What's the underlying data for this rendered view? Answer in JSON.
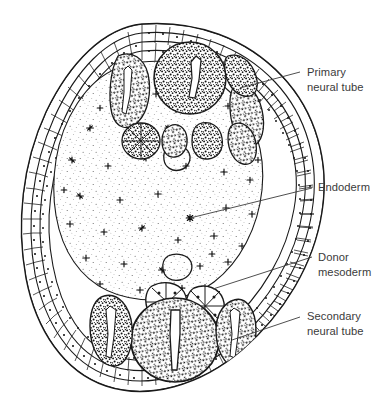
{
  "figure": {
    "name": "embryo-cross-section",
    "background_color": "#ffffff",
    "ink_color": "#1a1a1a",
    "label_color": "#3b3b3b"
  },
  "labels": [
    {
      "id": "primary-neural-tube",
      "lines": [
        "Primary",
        "neural tube"
      ],
      "text_x": 307,
      "text_y": 76,
      "leader": {
        "x1": 240,
        "y1": 88,
        "x2": 300,
        "y2": 72
      }
    },
    {
      "id": "endoderm",
      "lines": [
        "Endoderm"
      ],
      "text_x": 318,
      "text_y": 191,
      "leader": {
        "x1": 190,
        "y1": 218,
        "x2": 312,
        "y2": 188
      }
    },
    {
      "id": "donor-mesoderm",
      "lines": [
        "Donor",
        "mesoderm"
      ],
      "text_x": 318,
      "text_y": 261,
      "leader": {
        "x1": 213,
        "y1": 289,
        "x2": 312,
        "y2": 257
      }
    },
    {
      "id": "secondary-neural-tube",
      "lines": [
        "Secondary",
        "neural tube"
      ],
      "text_x": 307,
      "text_y": 320,
      "leader": {
        "x1": 232,
        "y1": 340,
        "x2": 300,
        "y2": 317
      }
    }
  ],
  "structures": {
    "outer_epidermis": "double-layered epithelial sheet with boxed cells",
    "endoderm_interior": "sparse stipple field with scattered star nuclei",
    "primary_tube": "dense stippled oval with slit lumen, upper region",
    "secondary_tube": "dense stippled oval with vertical slit lumen, lower region",
    "donor_mesoderm": "rosette cell clusters between the two tubes",
    "somites": "dense stippled blobs flanking both neural tubes",
    "vesicles": "two small outlined vesicles within the endoderm"
  }
}
